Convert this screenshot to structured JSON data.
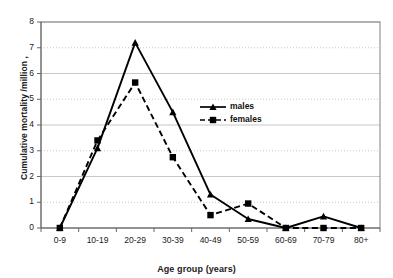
{
  "chart_data": {
    "type": "line",
    "title": "",
    "xlabel": "Age group (years)",
    "ylabel": "Cumulative mortality /million ,",
    "categories": [
      "0-9",
      "10-19",
      "20-29",
      "30-39",
      "40-49",
      "50-59",
      "60-69",
      "70-79",
      "80+"
    ],
    "ylim": [
      0,
      8
    ],
    "yticks": [
      "0",
      "1",
      "2",
      "3",
      "4",
      "5",
      "6",
      "7",
      "8"
    ],
    "grid": "horizontal-dotted",
    "legend_position": "middle-right-inside",
    "series": [
      {
        "name": "males",
        "marker": "triangle",
        "line_style": "solid",
        "color": "#000000",
        "values": [
          0,
          3.1,
          7.2,
          4.5,
          1.3,
          0.35,
          0,
          0.45,
          0
        ]
      },
      {
        "name": "females",
        "marker": "square",
        "line_style": "dashed",
        "color": "#000000",
        "values": [
          0,
          3.4,
          5.65,
          2.75,
          0.5,
          0.95,
          0,
          0,
          0
        ]
      }
    ]
  },
  "legend": {
    "entries": [
      {
        "label": "males"
      },
      {
        "label": "females"
      }
    ]
  },
  "axes": {
    "x_title": "Age group (years)",
    "y_title": "Cumulative mortality /million ,"
  }
}
